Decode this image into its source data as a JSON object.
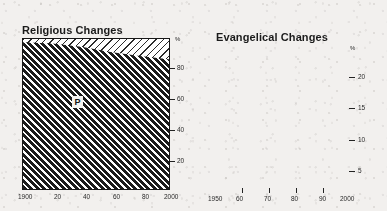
{
  "page": {
    "background_color": "#f2f0ee",
    "ink_color": "#1b1b1b"
  },
  "charts": {
    "religious": {
      "title": "Religious Changes",
      "y_unit": "%",
      "y_ticks": [
        "80",
        "60",
        "40",
        "20"
      ],
      "x_ticks": [
        "1900",
        "20",
        "40",
        "60",
        "80",
        "2000"
      ],
      "series_marker": "P"
    },
    "evangelical": {
      "title": "Evangelical Changes",
      "y_unit": "%",
      "y_ticks": [
        "20",
        "15",
        "10",
        "5"
      ],
      "x_ticks": [
        "1950",
        "60",
        "70",
        "80",
        "90",
        "2000"
      ]
    }
  },
  "chart_data": [
    {
      "type": "area",
      "title": "Religious Changes",
      "xlabel": "",
      "ylabel": "%",
      "xlim": [
        1900,
        2000
      ],
      "ylim": [
        0,
        100
      ],
      "grid": false,
      "legend_position": "inline-label",
      "x_tick_values": [
        1900,
        1920,
        1940,
        1960,
        1980,
        2000
      ],
      "x_tick_labels": [
        "1900",
        "20",
        "40",
        "60",
        "80",
        "2000"
      ],
      "y_tick_values": [
        20,
        40,
        60,
        80
      ],
      "y_tick_labels": [
        "20",
        "40",
        "60",
        "80"
      ],
      "stacked": true,
      "x": [
        1900,
        1920,
        1940,
        1960,
        1980,
        2000
      ],
      "series": [
        {
          "name": "P",
          "annotation": "P",
          "fill": "dense-diagonal-hatch-45deg",
          "values": [
            97.8,
            97.0,
            94.8,
            91.4,
            88.6,
            86.5
          ]
        },
        {
          "name": "Other",
          "fill": "sparse-diagonal-hatch-neg45deg",
          "values": [
            2.2,
            3.0,
            5.2,
            8.6,
            11.4,
            13.5
          ]
        }
      ]
    },
    {
      "type": "line",
      "title": "Evangelical Changes",
      "xlabel": "",
      "ylabel": "%",
      "xlim": [
        1950,
        2000
      ],
      "ylim": [
        0,
        22.5
      ],
      "grid": false,
      "legend_position": "none",
      "x_tick_values": [
        1950,
        1960,
        1970,
        1980,
        1990,
        2000
      ],
      "x_tick_labels": [
        "1950",
        "60",
        "70",
        "80",
        "90",
        "2000"
      ],
      "y_tick_values": [
        5,
        10,
        15,
        20
      ],
      "y_tick_labels": [
        "5",
        "10",
        "15",
        "20"
      ],
      "annotations": [
        {
          "type": "vline",
          "x": 1986,
          "style": "dashed",
          "label": ""
        }
      ],
      "x": [
        1950,
        1955,
        1960,
        1965,
        1970,
        1975,
        1978,
        1980,
        1985,
        1990,
        1995,
        2000
      ],
      "values": [
        8.3,
        8.1,
        8.0,
        8.0,
        8.3,
        9.2,
        9.7,
        9.7,
        9.6,
        9.5,
        9.6,
        9.8
      ]
    }
  ]
}
